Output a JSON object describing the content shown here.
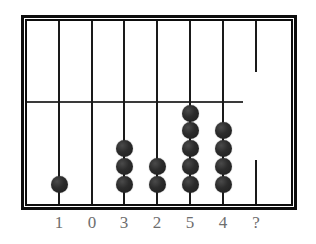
{
  "puzzle": {
    "type": "abacus-counting-frame",
    "title": "Abacus bead puzzle",
    "canvas": {
      "width": 316,
      "height": 244,
      "background": "#ffffff"
    },
    "frame": {
      "color": "#0d0d0d",
      "x": 21,
      "y": 15,
      "width": 276,
      "height": 195,
      "outer_border_width": 3,
      "inner_border_width": 2
    },
    "divider": {
      "color": "#3a3a3a",
      "y": 80,
      "width": 216,
      "note": "horizontal bar stops short of right frame edge"
    },
    "bead": {
      "color": "#2c2c2c",
      "diameter": 17
    },
    "rods": [
      {
        "label": "1",
        "x": 32,
        "bead_count": 1,
        "bead_y": [
          163
        ],
        "broken": false,
        "is_question": false
      },
      {
        "label": "0",
        "x": 65,
        "bead_count": 0,
        "bead_y": [],
        "broken": false,
        "is_question": false
      },
      {
        "label": "3",
        "x": 97,
        "bead_count": 3,
        "bead_y": [
          163,
          145,
          127
        ],
        "broken": false,
        "is_question": false
      },
      {
        "label": "2",
        "x": 130,
        "bead_count": 2,
        "bead_y": [
          163,
          145
        ],
        "broken": false,
        "is_question": false
      },
      {
        "label": "5",
        "x": 163,
        "bead_count": 5,
        "bead_y": [
          163,
          145,
          127,
          109,
          92
        ],
        "broken": false,
        "is_question": false
      },
      {
        "label": "4",
        "x": 196,
        "bead_count": 4,
        "bead_y": [
          163,
          145,
          127,
          109
        ],
        "broken": false,
        "is_question": false
      },
      {
        "label": "?",
        "x": 229,
        "bead_count": 0,
        "bead_y": [],
        "broken": true,
        "is_question": true
      }
    ],
    "labels": {
      "color": "#6e6e6e",
      "values": [
        "1",
        "0",
        "3",
        "2",
        "5",
        "4",
        "?"
      ]
    }
  },
  "chart_data": {
    "type": "bar",
    "xlabel": "",
    "ylabel": "Beads on rod",
    "categories": [
      "1",
      "0",
      "3",
      "2",
      "5",
      "4",
      "?"
    ],
    "values": [
      1,
      0,
      3,
      2,
      5,
      4,
      null
    ],
    "ylim": [
      0,
      5
    ],
    "grid": false,
    "legend": "none",
    "annotations": [
      "Rod labels read left to right: 1, 0, 3, 2, 5, 4, ?",
      "Bead counts match the rod labels for the six known rods",
      "The final rod is labelled ? and carries no beads",
      "The ? rod is drawn as two broken segments with a gap in the middle"
    ]
  }
}
